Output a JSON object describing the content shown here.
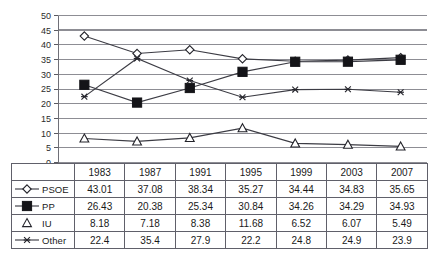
{
  "chart_data": {
    "type": "line",
    "title": "",
    "subtitle": "",
    "xlabel": "",
    "ylabel": "",
    "categories": [
      "1983",
      "1987",
      "1991",
      "1995",
      "1999",
      "2003",
      "2007"
    ],
    "ylim": [
      0,
      50
    ],
    "ytick_step": 5,
    "yticks": [
      "0",
      "5",
      "10",
      "15",
      "20",
      "25",
      "30",
      "35",
      "40",
      "45",
      "50"
    ],
    "grid": true,
    "legend_position": "table-row-headers",
    "series": [
      {
        "name": "PSOE",
        "marker": "open-diamond",
        "values": [
          43.01,
          37.08,
          38.34,
          35.27,
          34.44,
          34.83,
          35.65
        ]
      },
      {
        "name": "PP",
        "marker": "filled-square",
        "values": [
          26.43,
          20.38,
          25.34,
          30.84,
          34.26,
          34.29,
          34.93
        ]
      },
      {
        "name": "IU",
        "marker": "open-triangle",
        "values": [
          8.18,
          7.18,
          8.38,
          11.68,
          6.52,
          6.07,
          5.49
        ]
      },
      {
        "name": "Other",
        "marker": "star",
        "values": [
          22.4,
          35.4,
          27.9,
          22.2,
          24.8,
          24.9,
          23.9
        ]
      }
    ],
    "colors": {
      "line": "#3c3c44",
      "marker_fill_open": "#ffffff",
      "marker_fill_solid": "#141418",
      "gridline": "#8d8d94",
      "gridline_accent_45_left": "#9fe3d6",
      "gridline_accent_45_right": "#a99fad",
      "background": "#ffffff"
    }
  },
  "table": {
    "corner_label": "",
    "header_row": [
      "1983",
      "1987",
      "1991",
      "1995",
      "1999",
      "2003",
      "2007"
    ],
    "rows": [
      {
        "label": "PSOE",
        "marker": "open-diamond",
        "values": [
          "43.01",
          "37.08",
          "38.34",
          "35.27",
          "34.44",
          "34.83",
          "35.65"
        ]
      },
      {
        "label": "PP",
        "marker": "filled-square",
        "values": [
          "26.43",
          "20.38",
          "25.34",
          "30.84",
          "34.26",
          "34.29",
          "34.93"
        ]
      },
      {
        "label": "IU",
        "marker": "open-triangle",
        "values": [
          "8.18",
          "7.18",
          "8.38",
          "11.68",
          "6.52",
          "6.07",
          "5.49"
        ]
      },
      {
        "label": "Other",
        "marker": "star",
        "values": [
          "22.4",
          "35.4",
          "27.9",
          "22.2",
          "24.8",
          "24.9",
          "23.9"
        ]
      }
    ]
  }
}
